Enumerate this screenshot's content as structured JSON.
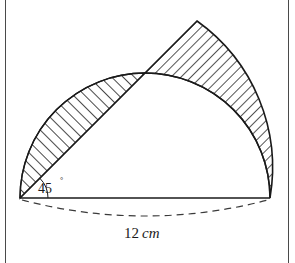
{
  "figure": {
    "background_color": "#ffffff",
    "stroke_color": "#1a1a1a",
    "frame_color": "#4a4a4a",
    "hatch_color": "#1a1a1a"
  },
  "labels": {
    "angle_value": "45",
    "angle_symbol": "°",
    "length_number": "12",
    "length_unit": "cm"
  },
  "geometry": {
    "diameter_left_x": 20,
    "diameter_left_y": 198,
    "diameter_right_x": 270,
    "diameter_right_y": 198,
    "center_x": 145,
    "center_y": 198,
    "radius": 125,
    "chord_angle_deg": 45,
    "arc_meet_x": 145,
    "arc_meet_y": 73,
    "sector_apex_x": 197,
    "sector_apex_y": 21,
    "dashed_arc_sag": 22
  },
  "regions": {
    "left_segment_name": "circular-segment-shaded",
    "left_hatch_direction": "up-right",
    "right_sector_name": "circular-sector-shaded",
    "right_hatch_direction": "down-right"
  }
}
